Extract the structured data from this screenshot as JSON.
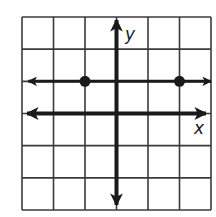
{
  "chart_data": {
    "type": "line",
    "title": "",
    "xlabel": "x",
    "ylabel": "y",
    "xlim": [
      -3,
      3
    ],
    "ylim": [
      -3,
      3
    ],
    "grid": true,
    "grid_step": 1,
    "legend": null,
    "series": [
      {
        "name": "horizontal line y = 1",
        "kind": "line",
        "equation": "y = 1",
        "arrows": "both",
        "x": [
          -2.8,
          3
        ],
        "y": [
          1,
          1
        ]
      },
      {
        "name": "plotted points",
        "kind": "scatter",
        "points": [
          {
            "x": -1,
            "y": 1
          },
          {
            "x": 2,
            "y": 1
          }
        ]
      }
    ]
  },
  "labels": {
    "x_axis": "x",
    "y_axis": "y"
  },
  "colors": {
    "grid": "#3a3a3a",
    "axes": "#1a1a1a",
    "line": "#1a1a1a",
    "points": "#1a1a1a",
    "background": "#ffffff"
  }
}
